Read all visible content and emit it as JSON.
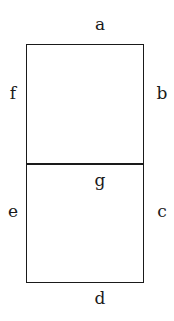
{
  "diagram": {
    "segments": [
      {
        "id": "a",
        "label": "a",
        "position": "top"
      },
      {
        "id": "b",
        "label": "b",
        "position": "upper-right"
      },
      {
        "id": "c",
        "label": "c",
        "position": "lower-right"
      },
      {
        "id": "d",
        "label": "d",
        "position": "bottom"
      },
      {
        "id": "e",
        "label": "e",
        "position": "lower-left"
      },
      {
        "id": "f",
        "label": "f",
        "position": "upper-left"
      },
      {
        "id": "g",
        "label": "g",
        "position": "middle"
      }
    ],
    "colors": {
      "stroke": "#1a1a1a",
      "background": "#ffffff"
    }
  }
}
